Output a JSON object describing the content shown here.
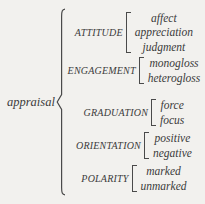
{
  "root_label": "appraisal",
  "groups": [
    {
      "label": "ATTITUDE",
      "items": [
        "affect",
        "appreciation",
        "judgment"
      ]
    },
    {
      "label": "ENGAGEMENT",
      "items": [
        "monogloss",
        "heterogloss"
      ]
    },
    {
      "label": "GRADUATION",
      "items": [
        "force",
        "focus"
      ]
    },
    {
      "label": "ORIENTATION",
      "items": [
        "positive",
        "negative"
      ]
    },
    {
      "label": "POLARITY",
      "items": [
        "marked",
        "unmarked"
      ]
    }
  ],
  "colors": {
    "background": "#f2f1ee",
    "text": "#3b3b3b",
    "bracket": "#4a4a4a"
  }
}
